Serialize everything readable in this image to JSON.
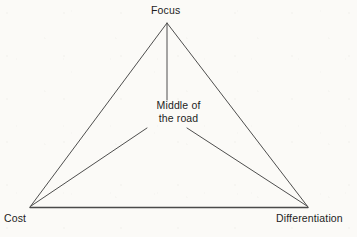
{
  "diagram": {
    "type": "triangle-strategy-diagram",
    "background_color": "#fbfaf7",
    "line_color": "#3a3a3a",
    "text_color": "#1d1d1d",
    "vertices": [
      {
        "id": "focus",
        "label": "Focus",
        "x": 167,
        "y": 22,
        "label_x": 151,
        "label_y": 4
      },
      {
        "id": "cost",
        "label": "Cost",
        "x": 30,
        "y": 207,
        "label_x": 4,
        "label_y": 212
      },
      {
        "id": "differentiation",
        "label": "Differentiation",
        "x": 308,
        "y": 207,
        "label_x": 276,
        "label_y": 212
      }
    ],
    "center": {
      "id": "middle-of-the-road",
      "label_line_1": "Middle of",
      "label_line_2": "the road",
      "x": 167,
      "y": 112
    },
    "edges": [
      {
        "id": "edge-focus-cost",
        "from": "focus",
        "to": "cost"
      },
      {
        "id": "edge-focus-differentiation",
        "from": "focus",
        "to": "differentiation"
      },
      {
        "id": "edge-cost-differentiation",
        "from": "cost",
        "to": "differentiation"
      }
    ],
    "spokes": [
      {
        "id": "spoke-focus-center",
        "from": "focus",
        "to": "center",
        "x1": 167,
        "y1": 24,
        "x2": 167,
        "y2": 100
      },
      {
        "id": "spoke-center-cost",
        "from": "center",
        "to": "cost",
        "x1": 147,
        "y1": 128,
        "x2": 31,
        "y2": 206
      },
      {
        "id": "spoke-center-differentiation",
        "from": "center",
        "to": "differentiation",
        "x1": 187,
        "y1": 128,
        "x2": 307,
        "y2": 206
      }
    ]
  }
}
